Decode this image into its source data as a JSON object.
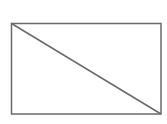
{
  "diagram": {
    "canvas": {
      "width": 167,
      "height": 124,
      "background": "#ffffff"
    },
    "stroke_color": "#6a6a6a",
    "stroke_width": 1.5,
    "rectangle": {
      "x": 11.5,
      "y": 23.5,
      "width": 149.5,
      "height": 90.5
    },
    "diagonal": {
      "x1": 11.5,
      "y1": 23.5,
      "x2": 161,
      "y2": 114
    },
    "labels": []
  }
}
